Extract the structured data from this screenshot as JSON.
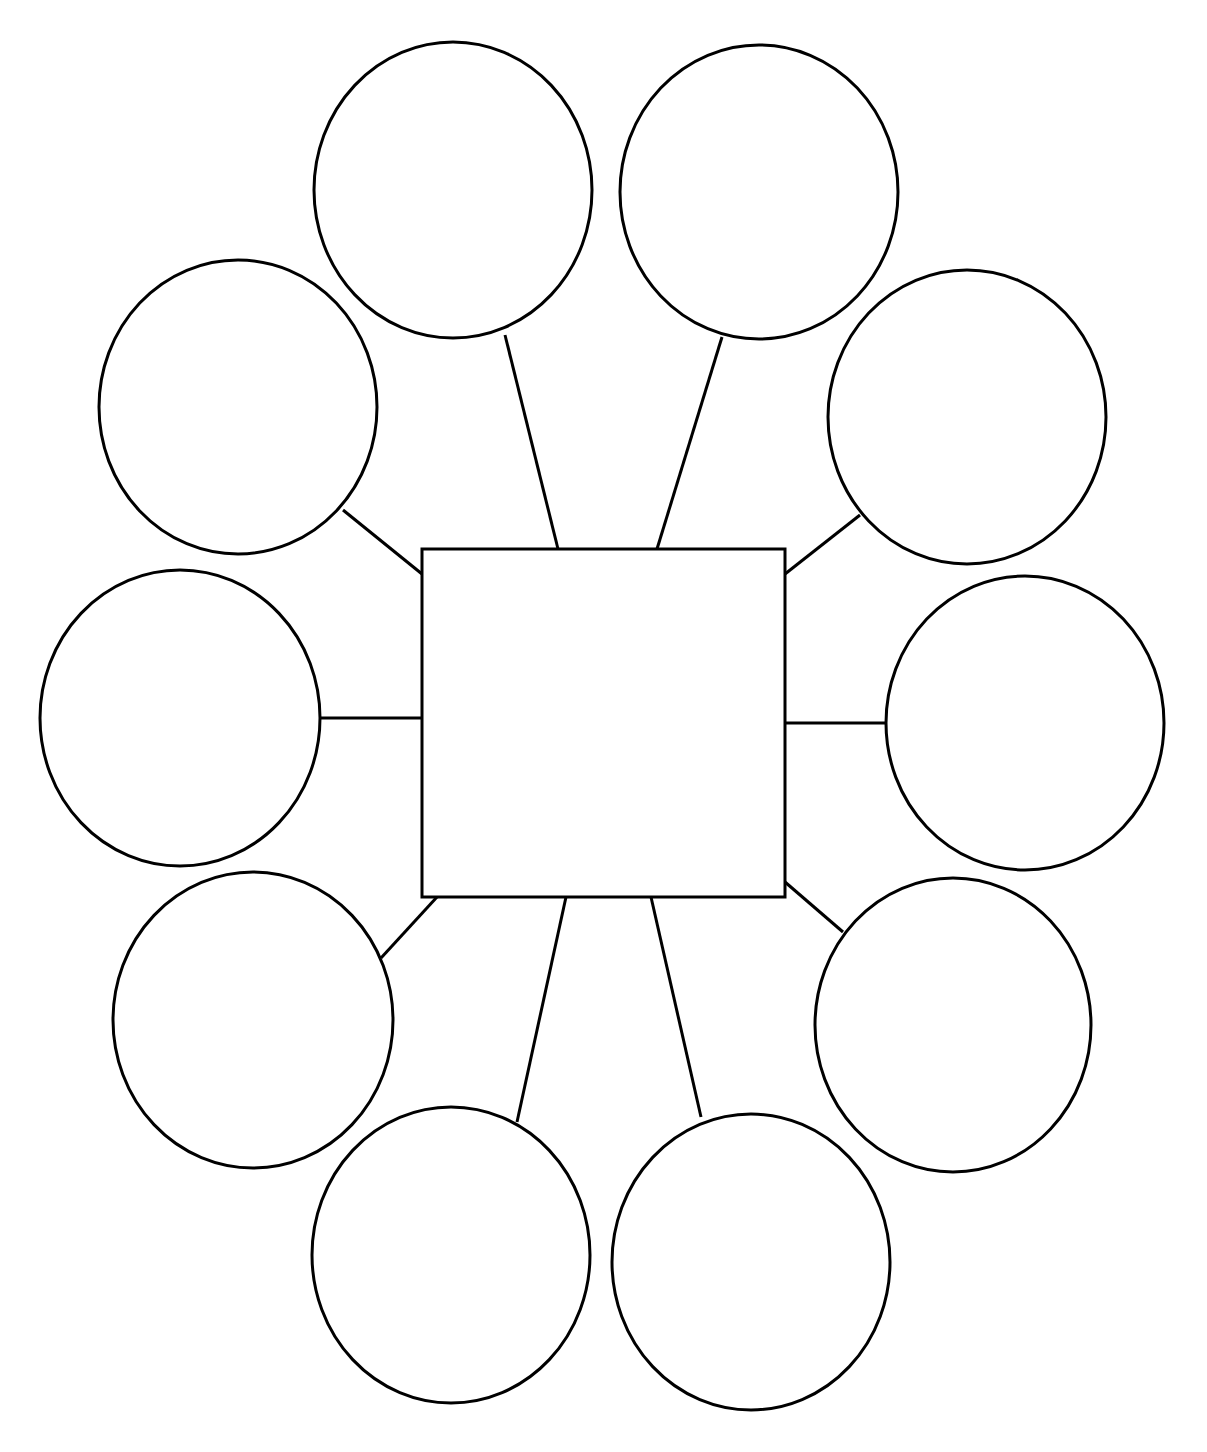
{
  "diagram": {
    "type": "bubble-map",
    "background": "#ffffff",
    "stroke_color": "#000000",
    "title": "",
    "center": {
      "label": "",
      "x": 422,
      "y": 549,
      "width": 363,
      "height": 348
    },
    "bubbles": [
      {
        "id": "top-left",
        "label": "",
        "cx": 453,
        "cy": 190,
        "rx": 139,
        "ry": 148,
        "line": [
          505,
          335,
          558,
          549
        ]
      },
      {
        "id": "top-right",
        "label": "",
        "cx": 759,
        "cy": 192,
        "rx": 139,
        "ry": 147,
        "line": [
          722,
          337,
          657,
          549
        ]
      },
      {
        "id": "upper-left",
        "label": "",
        "cx": 238,
        "cy": 407,
        "rx": 139,
        "ry": 147,
        "line": [
          343,
          510,
          422,
          574
        ]
      },
      {
        "id": "upper-right",
        "label": "",
        "cx": 967,
        "cy": 417,
        "rx": 139,
        "ry": 147,
        "line": [
          860,
          515,
          785,
          574
        ]
      },
      {
        "id": "middle-left",
        "label": "",
        "cx": 180,
        "cy": 718,
        "rx": 140,
        "ry": 148,
        "line": [
          320,
          718,
          422,
          718
        ]
      },
      {
        "id": "middle-right",
        "label": "",
        "cx": 1025,
        "cy": 723,
        "rx": 139,
        "ry": 147,
        "line": [
          886,
          723,
          785,
          723
        ]
      },
      {
        "id": "lower-left",
        "label": "",
        "cx": 253,
        "cy": 1020,
        "rx": 140,
        "ry": 148,
        "line": [
          381,
          958,
          437,
          897
        ]
      },
      {
        "id": "lower-right",
        "label": "",
        "cx": 953,
        "cy": 1025,
        "rx": 138,
        "ry": 147,
        "line": [
          843,
          932,
          785,
          882
        ]
      },
      {
        "id": "bottom-left",
        "label": "",
        "cx": 451,
        "cy": 1255,
        "rx": 139,
        "ry": 148,
        "line": [
          517,
          1122,
          566,
          897
        ]
      },
      {
        "id": "bottom-right",
        "label": "",
        "cx": 751,
        "cy": 1262,
        "rx": 139,
        "ry": 148,
        "line": [
          701,
          1117,
          651,
          897
        ]
      }
    ]
  }
}
